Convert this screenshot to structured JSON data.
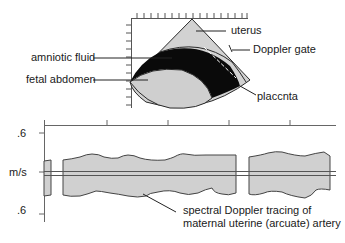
{
  "ultrasound": {
    "labels": {
      "uterus": "uterus",
      "doppler_gate": "Doppler gate",
      "amniotic_fluid": "amniotic fluid",
      "fetal_abdomen": "fetal abdomen",
      "placenta": "placcnta"
    }
  },
  "tracing": {
    "y_axis": {
      "top_tick": ".6",
      "unit": "m/s",
      "bottom_tick": ".6"
    },
    "caption_line1": "spectral Doppler tracing of",
    "caption_line2": "maternal uterine (arcuate) artery"
  },
  "colors": {
    "tissue_fill": "#d2d2d2",
    "fluid_fill": "#0a0a0a",
    "line": "#3a3a3a"
  }
}
